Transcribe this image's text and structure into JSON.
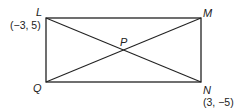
{
  "diagram": {
    "type": "rectangle-with-diagonals",
    "vertices": {
      "L": {
        "label": "L",
        "coord": "(−3, 5)"
      },
      "M": {
        "label": "M"
      },
      "N": {
        "label": "N",
        "coord": "(3, −5)"
      },
      "Q": {
        "label": "Q"
      }
    },
    "intersection": {
      "label": "P"
    },
    "line_color": "#222222"
  }
}
